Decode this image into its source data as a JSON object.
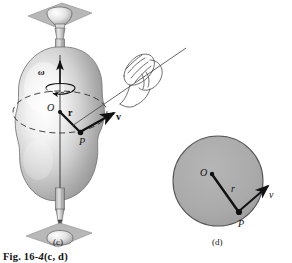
{
  "figure": {
    "caption_prefix": "Fig. 16",
    "caption_dash": "-",
    "caption_number": "4",
    "caption_suffix": "(c, d)",
    "caption_full": "Fig. 16-4(c, d)",
    "background_color": "#ffffff",
    "ink_color": "#111111"
  },
  "panel_c": {
    "tag": "(c)",
    "description": "Rigid body mounted on a vertical axle spun by a hand pulling a string",
    "labels": {
      "omega": "ω",
      "center": "O",
      "radius_vector": "r",
      "point": "P",
      "velocity_vector": "v"
    },
    "colors": {
      "body_fill": "#d8d8d8",
      "body_highlight": "#f7f7f7",
      "body_shadow": "#8e8e8e",
      "bracket_plate": "#b4b4b4",
      "shaft": "#c9c9c9",
      "dashed_path": "#2a2a2a"
    },
    "elements": [
      "top-mounting-plate",
      "top-bearing",
      "upper-shaft",
      "irregular-rigid-body",
      "rotation-axis",
      "dashed-circular-path",
      "omega-curved-arrow",
      "radius-vector",
      "velocity-vector",
      "lower-shaft",
      "bottom-bearing",
      "bottom-mounting-plate",
      "hand-pulling-string",
      "string-line"
    ]
  },
  "panel_d": {
    "tag": "(d)",
    "description": "Top view: circular path of point P with radius r and tangential velocity v",
    "labels": {
      "center": "O",
      "radius_vector": "r",
      "point": "P",
      "velocity_vector": "v"
    },
    "colors": {
      "disk_fill": "#aaaaaa",
      "disk_stroke": "#4a4a4a"
    },
    "geometry": {
      "center_x": 218,
      "center_y": 181,
      "radius": 45
    }
  }
}
